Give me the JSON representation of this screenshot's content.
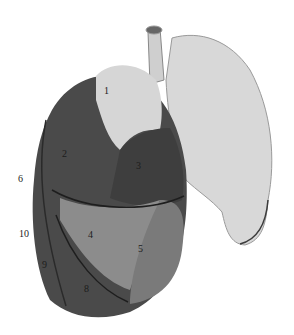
{
  "figure": {
    "labels": [
      {
        "text": "1",
        "x": 104,
        "y": 90
      },
      {
        "text": "2",
        "x": 62,
        "y": 153
      },
      {
        "text": "3",
        "x": 136,
        "y": 165
      },
      {
        "text": "4",
        "x": 88,
        "y": 234
      },
      {
        "text": "5",
        "x": 138,
        "y": 248
      },
      {
        "text": "6",
        "x": 18,
        "y": 178
      },
      {
        "text": "8",
        "x": 84,
        "y": 288
      },
      {
        "text": "9",
        "x": 42,
        "y": 264
      },
      {
        "text": "10",
        "x": 19,
        "y": 233
      }
    ]
  }
}
